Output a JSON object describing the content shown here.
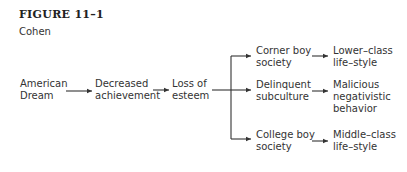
{
  "figure": {
    "title": "FIGURE 11–1",
    "author": "Cohen"
  },
  "nodes": {
    "american_dream": [
      "American",
      "Dream"
    ],
    "decreased_achievement": [
      "Decreased",
      "achievement"
    ],
    "loss_of_esteem": [
      "Loss of",
      "esteem"
    ],
    "corner_boy": [
      "Corner boy",
      "society"
    ],
    "delinquent": [
      "Delinquent",
      "subculture"
    ],
    "college_boy": [
      "College boy",
      "society"
    ],
    "lower_class": [
      "Lower–class",
      "life–style"
    ],
    "malicious": [
      "Malicious",
      "negativistic",
      "behavior"
    ],
    "middle_class": [
      "Middle–class",
      "life–style"
    ]
  },
  "colors": {
    "line": "#333333",
    "text": "#333333"
  }
}
